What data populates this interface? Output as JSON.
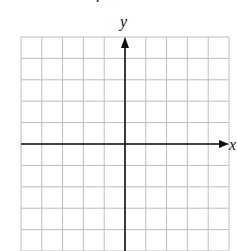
{
  "figure": {
    "type": "coordinate-plane",
    "top_fragment": ".",
    "axes": {
      "x_label": "x",
      "y_label": "y",
      "arrows": "positive-direction-only"
    },
    "grid": {
      "columns": 10,
      "rows": 10,
      "left": 21,
      "top": 37,
      "cell_width": 20.8,
      "cell_height": 21.4,
      "origin_col": 5,
      "origin_row": 5,
      "line_color": "#bdbdbd",
      "axis_color": "#111111"
    }
  }
}
